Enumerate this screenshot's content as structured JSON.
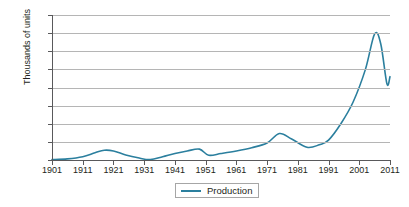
{
  "chart_data": {
    "type": "line",
    "title": "",
    "xlabel": "",
    "ylabel": "Thousands of units",
    "xlim": [
      1901,
      2011
    ],
    "ylim": [
      0,
      400
    ],
    "grid": true,
    "legend_position": "bottom-center",
    "y_ticks": [
      "400.0",
      "350.0",
      "300.0",
      "250.0",
      "200.0",
      "150.0",
      "100.0",
      "50.0",
      "0.0"
    ],
    "y_tick_values": [
      400,
      350,
      300,
      250,
      200,
      150,
      100,
      50,
      0
    ],
    "x_ticks": [
      "1901",
      "1911",
      "1921",
      "1931",
      "1941",
      "1951",
      "1961",
      "1971",
      "1981",
      "1991",
      "2001",
      "2011"
    ],
    "x_tick_values": [
      1901,
      1911,
      1921,
      1931,
      1941,
      1951,
      1961,
      1971,
      1981,
      1991,
      2001,
      2011
    ],
    "series": [
      {
        "name": "Production",
        "color": "#2b7f9e",
        "x": [
          1901,
          1906,
          1911,
          1915,
          1918,
          1921,
          1925,
          1929,
          1933,
          1937,
          1941,
          1945,
          1949,
          1952,
          1956,
          1961,
          1966,
          1971,
          1975,
          1979,
          1984,
          1988,
          1991,
          1995,
          1999,
          2003,
          2006,
          2008,
          2010,
          2011
        ],
        "values": [
          1,
          3,
          9,
          20,
          27,
          25,
          14,
          6,
          1,
          9,
          18,
          25,
          30,
          13,
          18,
          25,
          34,
          47,
          73,
          58,
          35,
          42,
          55,
          100,
          160,
          250,
          348,
          320,
          210,
          230
        ]
      }
    ],
    "legend": [
      {
        "label": "Production",
        "color": "#2b7f9e"
      }
    ]
  },
  "colors": {
    "series": "#2b7f9e",
    "gridline": "#b5b5b5",
    "axis": "#59595b",
    "text": "#231f20",
    "background": "#ffffff"
  }
}
